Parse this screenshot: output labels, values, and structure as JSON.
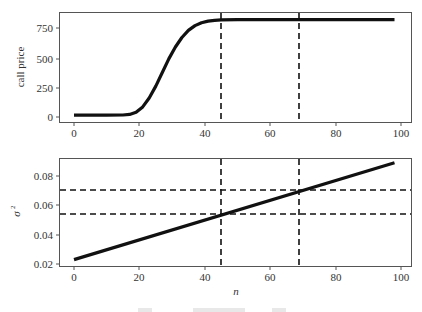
{
  "chart_data": [
    {
      "type": "line",
      "title": "",
      "xlabel": "",
      "ylabel": "call price",
      "xlim": [
        -3,
        102
      ],
      "ylim": [
        -20,
        860
      ],
      "xticks": [
        0,
        20,
        40,
        60,
        80,
        100
      ],
      "yticks": [
        0,
        250,
        500,
        750
      ],
      "grid": false,
      "series": [
        {
          "name": "call price",
          "x": [
            0,
            5,
            10,
            15,
            17,
            19,
            21,
            23,
            25,
            27,
            29,
            31,
            33,
            35,
            37,
            39,
            41,
            43,
            45,
            50,
            60,
            70,
            80,
            90,
            98
          ],
          "values": [
            15,
            15,
            15,
            17,
            22,
            40,
            85,
            160,
            260,
            375,
            490,
            590,
            670,
            730,
            770,
            795,
            808,
            815,
            818,
            820,
            820,
            820,
            820,
            820,
            820
          ]
        }
      ],
      "vlines": [
        45,
        69
      ],
      "hlines": []
    },
    {
      "type": "line",
      "title": "",
      "xlabel": "n",
      "ylabel": "σ²",
      "xlim": [
        -3,
        102
      ],
      "ylim": [
        0.02,
        0.093
      ],
      "xticks": [
        0,
        20,
        40,
        60,
        80,
        100
      ],
      "yticks": [
        0.02,
        0.04,
        0.06,
        0.08
      ],
      "grid": false,
      "series": [
        {
          "name": "sigma squared",
          "x": [
            0,
            98
          ],
          "values": [
            0.023,
            0.089
          ]
        }
      ],
      "vlines": [
        45,
        69
      ],
      "hlines": [
        0.054,
        0.07
      ]
    }
  ],
  "top_plot": {
    "ylabel": "call price",
    "yticks": [
      "0",
      "250",
      "500",
      "750"
    ],
    "xticks": [
      "0",
      "20",
      "40",
      "60",
      "80",
      "100"
    ]
  },
  "bottom_plot": {
    "ylabel": "σ",
    "ylabel_sup": "2",
    "xlabel": "n",
    "yticks": [
      "0.02",
      "0.04",
      "0.06",
      "0.08"
    ],
    "xticks": [
      "0",
      "20",
      "40",
      "60",
      "80",
      "100"
    ]
  }
}
